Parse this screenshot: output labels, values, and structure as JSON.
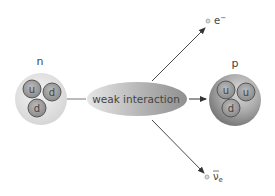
{
  "diagram": {
    "neutron": {
      "label": "n",
      "quarks": [
        "u",
        "d",
        "d"
      ]
    },
    "proton": {
      "label": "p",
      "quarks": [
        "u",
        "u",
        "d"
      ]
    },
    "process": {
      "label": "weak interaction"
    },
    "products": [
      {
        "id": "electron",
        "label_base": "e",
        "label_sup": "−"
      },
      {
        "id": "antineutrino",
        "label_base": "ν",
        "label_sub": "e",
        "overline": true
      }
    ],
    "colors": {
      "quark_fill": "#9a9a9a",
      "quark_stroke": "#555555",
      "hadron_fill": "#e4e4e4",
      "proton_fill": "#9c9c9c",
      "ellipse_fill": "#bdbdbd",
      "arrow": "#333333",
      "label": "#444444"
    }
  }
}
